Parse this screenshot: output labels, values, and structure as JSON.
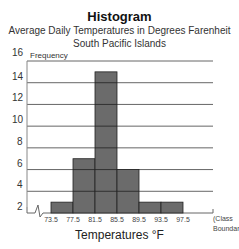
{
  "chart_data": {
    "type": "bar",
    "title": "Histogram",
    "subtitle": [
      "Average Daily Temperatures in Degrees Farenheit",
      "South Pacific Islands"
    ],
    "xlabel": "Temperatures °F",
    "ylabel": "Frequency",
    "x_boundary_label": [
      "(Class",
      "Boundaries)"
    ],
    "bin_edges": [
      73.5,
      77.5,
      81.5,
      85.5,
      89.5,
      93.5,
      97.5
    ],
    "categories": [
      "73.5-77.5",
      "77.5-81.5",
      "81.5-85.5",
      "85.5-89.5",
      "89.5-93.5",
      "93.5-97.5"
    ],
    "values": [
      3,
      7,
      15,
      6,
      3,
      3
    ],
    "yticks": [
      2,
      4,
      6,
      8,
      10,
      12,
      14,
      16
    ],
    "ylim": [
      1,
      16
    ],
    "grid": true,
    "axis_break": true,
    "bar_color": "#6b6b6b"
  },
  "title": "Histogram",
  "subtitle1": "Average Daily Temperatures in Degrees Farenheit",
  "subtitle2": "South Pacific Islands",
  "ylabel": "Frequency",
  "xlabel": "Temperatures °F",
  "classb1": "(Class",
  "classb2": "Boundaries)"
}
